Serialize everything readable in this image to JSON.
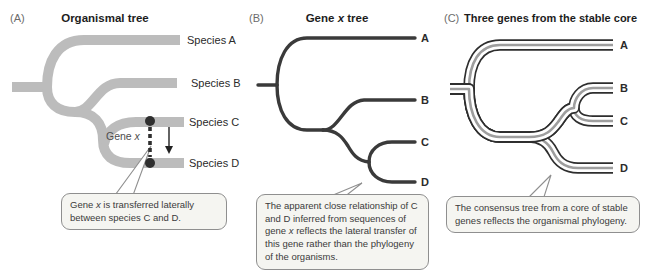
{
  "panels": {
    "a": {
      "tag": "(A)",
      "title": "Organismal tree",
      "tips": [
        "Species A",
        "Species B",
        "Species C",
        "Species D"
      ],
      "gene_label": {
        "pre": "Gene ",
        "x": "x"
      },
      "callout": {
        "pre": "Gene ",
        "x": "x",
        "post": " is transferred laterally between species C and D."
      }
    },
    "b": {
      "tag": "(B)",
      "title": {
        "pre": "Gene ",
        "x": "x",
        "post": " tree"
      },
      "tips": [
        "A",
        "B",
        "C",
        "D"
      ],
      "callout": {
        "pre": "The apparent close relationship of C and D inferred from sequences of gene ",
        "x": "x",
        "post": " reflects the lateral transfer of this gene rather than the phylogeny of the organisms."
      }
    },
    "c": {
      "tag": "(C)",
      "title": "Three genes from the stable core",
      "tips": [
        "A",
        "B",
        "C",
        "D"
      ],
      "callout": "The consensus tree from a core of stable genes reflects the organismal phylogeny."
    }
  },
  "colors": {
    "organismal_branch": "#bcbcbc",
    "gene_tree_line": "#3a3a3a",
    "core_gene_dark": "#2e2e2e",
    "core_gene_light": "#9e9e9e",
    "transfer_marker": "#2f2f2f",
    "callout_border": "#8f8f8f",
    "callout_fill": "#f5f5f1"
  },
  "icons": {
    "transfer_arrow": "downward-arrow",
    "transfer_path": "vertical-dashed-line",
    "transfer_endpoints": "filled-dots"
  }
}
